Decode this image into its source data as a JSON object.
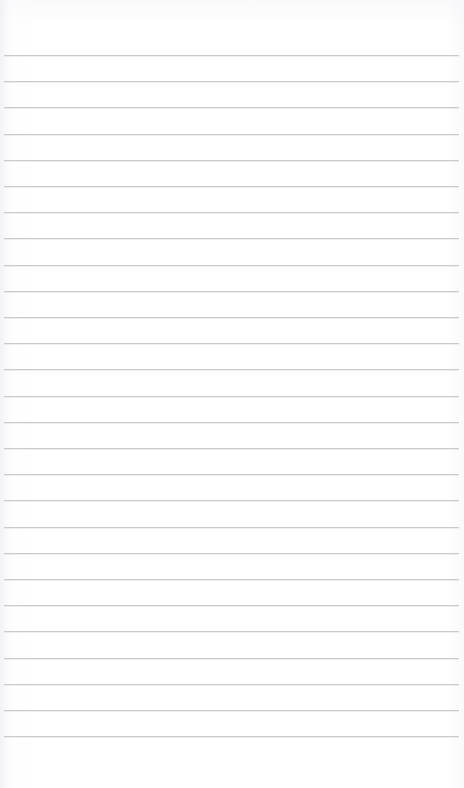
{
  "document": {
    "kind": "ruled-notebook-page",
    "title": "",
    "body_text": "",
    "background_color": "#ffffff",
    "page_width": 464,
    "page_height": 788
  },
  "ruling": {
    "line_color": "#c9c9ce",
    "line_thickness": 1,
    "line_spacing": 26.2,
    "first_line_y": 55,
    "last_line_y": 735,
    "line_count": 27,
    "line_start_x": 4,
    "line_end_x": 459
  },
  "margins": {
    "top_margin_label": "",
    "bottom_margin_label": "",
    "top_margin_height": 55,
    "bottom_margin_height": 53,
    "left_margin_rule": false,
    "right_margin_rule": false
  },
  "content": {
    "has_handwriting": false,
    "has_printed_text": false,
    "notes": ""
  }
}
